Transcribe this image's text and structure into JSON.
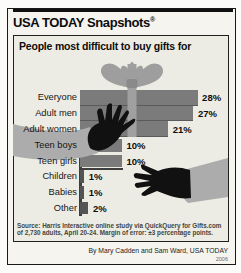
{
  "window": {
    "width": 241,
    "height": 273
  },
  "header": {
    "brand": "USA TODAY Snapshots",
    "registered": "®"
  },
  "title": "People most difficult to buy gifts for",
  "chart_data": {
    "type": "bar",
    "orientation": "horizontal",
    "title": "People most difficult to buy gifts for",
    "categories": [
      "Everyone",
      "Adult men",
      "Adult women",
      "Teen boys",
      "Teen girls",
      "Children",
      "Babies",
      "Other"
    ],
    "values": [
      28,
      27,
      21,
      10,
      10,
      1,
      1,
      2
    ],
    "value_labels": [
      "28%",
      "27%",
      "21%",
      "10%",
      "10%",
      "1%",
      "1%",
      "2%"
    ],
    "unit": "percent",
    "xlim": [
      0,
      30
    ],
    "grid": false,
    "legend": null,
    "decorations": [
      "gift-bow-icon",
      "gift-ribbon",
      "reaching-hand-left-icon",
      "reaching-hand-right-icon"
    ]
  },
  "source": {
    "line1": "Source: Harris Interactive online study via QuickQuery for Gifts.com",
    "line2": "of 2,730 adults, April 20-24. Margin of error: ±3 percentage points."
  },
  "credit": "By Mary Cadden and Sam Ward, USA TODAY",
  "edition_year": "2006",
  "colors": {
    "panel_bg": "#f5f4ef",
    "chart_bg": "#edece4",
    "bar": "#7b7b7b",
    "bar_small": "#545454",
    "bar_seam": "#5a5a5a",
    "ribbon": "#a0a0a0",
    "bow": "#9e9e9e",
    "knot": "#8a8a8a",
    "sleeve": "#acacac",
    "hand": "#111111",
    "rule": "#101010"
  }
}
